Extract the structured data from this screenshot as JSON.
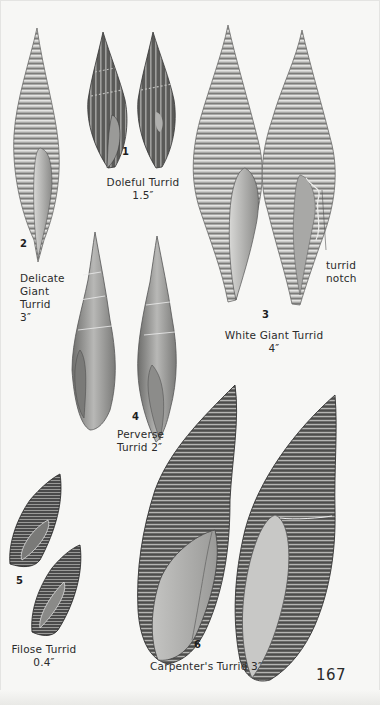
{
  "page": {
    "page_number": "167",
    "colors": {
      "paper": "#f7f7f5",
      "ink": "#2a2a2a",
      "shell_light": "#c8c8c6",
      "shell_mid": "#8e8e8c",
      "shell_dark": "#3e3e3e"
    }
  },
  "plates": [
    {
      "number": "1",
      "name": "Doleful Turrid",
      "size": "1.5″"
    },
    {
      "number": "2",
      "name_lines": [
        "Delicate",
        "Giant",
        "Turrid"
      ],
      "size": "3″"
    },
    {
      "number": "3",
      "name": "White Giant Turrid",
      "size": "4″",
      "annotation_lines": [
        "turrid",
        "notch"
      ]
    },
    {
      "number": "4",
      "name_lines": [
        "Perverse",
        "Turrid 2″"
      ]
    },
    {
      "number": "5",
      "name": "Filose Turrid",
      "size": "0.4″"
    },
    {
      "number": "6",
      "name": "Carpenter's Turrid 3″"
    }
  ]
}
